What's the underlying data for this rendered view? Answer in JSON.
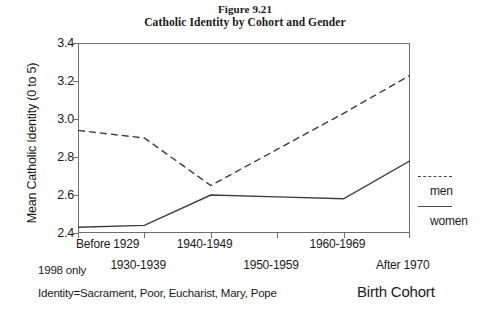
{
  "figure": {
    "number": "Figure 9.21",
    "title": "Catholic Identity by Cohort and Gender"
  },
  "notes": {
    "period": "1998 only",
    "identity": "Identity=Sacrament, Poor, Eucharist, Mary, Pope"
  },
  "legend": {
    "men_label": "men",
    "women_label": "women"
  },
  "colors": {
    "line": "#3c3c3c",
    "frame": "#6e6e6e",
    "text": "#1a1a1a",
    "background": "#ffffff"
  },
  "chart_data": {
    "type": "line",
    "title": "Catholic Identity by Cohort and Gender",
    "subtitle": "Figure 9.21",
    "xlabel": "Birth Cohort",
    "ylabel": "Mean Catholic Identity (0 to 5)",
    "categories": [
      "Before 1929",
      "1930-1939",
      "1940-1949",
      "1950-1959",
      "1960-1969",
      "After 1970"
    ],
    "series": [
      {
        "name": "men",
        "style": "dashed",
        "values": [
          2.94,
          2.9,
          2.65,
          2.84,
          3.03,
          3.23
        ]
      },
      {
        "name": "women",
        "style": "solid",
        "values": [
          2.43,
          2.44,
          2.6,
          2.59,
          2.58,
          2.78
        ]
      }
    ],
    "ylim": [
      2.4,
      3.4
    ],
    "yticks": [
      "2.4",
      "2.6",
      "2.8",
      "3.0",
      "3.2",
      "3.4"
    ],
    "ytick_values": [
      2.4,
      2.6,
      2.8,
      3.0,
      3.2,
      3.4
    ],
    "grid": false,
    "legend_position": "right"
  }
}
